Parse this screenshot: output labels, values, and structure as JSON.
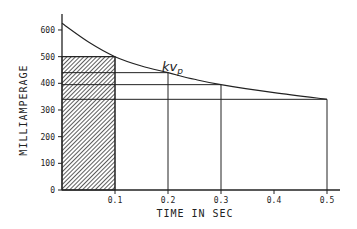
{
  "chart_data": {
    "type": "line",
    "title": "",
    "xlabel": "TIME IN SEC",
    "ylabel": "MILLIAMPERAGE",
    "xlim": [
      0,
      0.52
    ],
    "ylim": [
      0,
      650
    ],
    "x_ticks": [
      0.1,
      0.2,
      0.3,
      0.4,
      0.5
    ],
    "x_tick_labels": [
      "0.1",
      "0.2",
      "0.3",
      "0.4",
      "0.5"
    ],
    "y_ticks": [
      0,
      100,
      200,
      300,
      400,
      500,
      600
    ],
    "y_tick_labels": [
      "0",
      "100",
      "200",
      "300",
      "400",
      "500",
      "600"
    ],
    "grid": false,
    "legend": null,
    "series": [
      {
        "name": "kVp",
        "x": [
          0,
          0.05,
          0.1,
          0.15,
          0.2,
          0.25,
          0.3,
          0.4,
          0.5
        ],
        "values": [
          625,
          555,
          500,
          465,
          440,
          415,
          395,
          365,
          340
        ]
      }
    ],
    "reference_lines": [
      {
        "time": 0.1,
        "mA": 500,
        "shaded": true
      },
      {
        "time": 0.2,
        "mA": 440,
        "shaded": false
      },
      {
        "time": 0.3,
        "mA": 395,
        "shaded": false
      },
      {
        "time": 0.5,
        "mA": 340,
        "shaded": false
      }
    ],
    "annotations": [
      {
        "text": "kV",
        "subscript": "p",
        "x": 0.17,
        "y": 470
      }
    ]
  }
}
